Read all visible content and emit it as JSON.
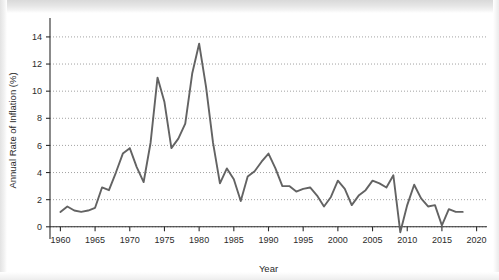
{
  "chart_data": {
    "type": "line",
    "title": "",
    "xlabel": "Year",
    "ylabel": "Annual Rate of Inflation (%)",
    "xlim": [
      1958.5,
      2021.5
    ],
    "ylim": [
      -0.9,
      15.1
    ],
    "grid": "horizontal-dotted",
    "legend": "none",
    "line_color": "#636363",
    "xticks": [
      1960,
      1965,
      1970,
      1975,
      1980,
      1985,
      1990,
      1995,
      2000,
      2005,
      2010,
      2015,
      2020
    ],
    "xtick_labels": [
      "1960",
      "1965",
      "1970",
      "1975",
      "1980",
      "1985",
      "1990",
      "1995",
      "2000",
      "2005",
      "2010",
      "2015",
      "2020"
    ],
    "yticks": [
      0,
      2,
      4,
      6,
      8,
      10,
      12,
      14
    ],
    "ytick_labels": [
      "0",
      "2",
      "4",
      "6",
      "8",
      "10",
      "12",
      "14"
    ],
    "x": [
      1960,
      1961,
      1962,
      1963,
      1964,
      1965,
      1966,
      1967,
      1968,
      1969,
      1970,
      1971,
      1972,
      1973,
      1974,
      1975,
      1976,
      1977,
      1978,
      1979,
      1980,
      1981,
      1982,
      1983,
      1984,
      1985,
      1986,
      1987,
      1988,
      1989,
      1990,
      1991,
      1992,
      1993,
      1994,
      1995,
      1996,
      1997,
      1998,
      1999,
      2000,
      2001,
      2002,
      2003,
      2004,
      2005,
      2006,
      2007,
      2008,
      2009,
      2010,
      2011,
      2012,
      2013,
      2014,
      2015,
      2016,
      2017,
      2018
    ],
    "values": [
      1.1,
      1.5,
      1.2,
      1.1,
      1.2,
      1.4,
      2.9,
      2.7,
      4.0,
      5.4,
      5.8,
      4.4,
      3.3,
      6.2,
      11.0,
      9.2,
      5.8,
      6.5,
      7.6,
      11.3,
      13.5,
      10.3,
      6.2,
      3.2,
      4.3,
      3.5,
      1.9,
      3.7,
      4.1,
      4.8,
      5.4,
      4.3,
      3.0,
      3.0,
      2.6,
      2.8,
      2.9,
      2.3,
      1.5,
      2.2,
      3.4,
      2.8,
      1.6,
      2.3,
      2.7,
      3.4,
      3.2,
      2.9,
      3.8,
      -0.4,
      1.6,
      3.1,
      2.1,
      1.5,
      1.6,
      0.1,
      1.3,
      1.1,
      1.1
    ],
    "series_name": "Annual Rate of Inflation"
  },
  "axes": {
    "y_title": "Annual Rate of Inflation (%)",
    "x_title": "Year"
  }
}
